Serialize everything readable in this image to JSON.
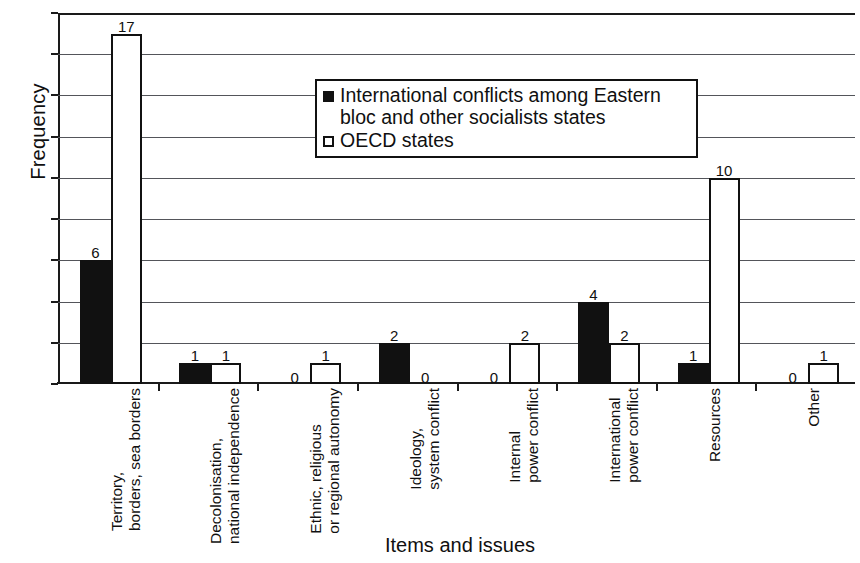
{
  "chart_data": {
    "type": "bar",
    "title": "",
    "xlabel": "Items and issues",
    "ylabel": "Frequency",
    "ylim": [
      0,
      18
    ],
    "ytick_step": 2,
    "yticks": [
      0,
      2,
      4,
      6,
      8,
      10,
      12,
      14,
      16,
      18
    ],
    "grid": true,
    "legend_position": "inside-top-center",
    "categories": [
      "Territory, borders, sea borders",
      "Decolonisation, national independence",
      "Ethnic, religious or regional autonomy",
      "Ideology, system conflict",
      "Internal power conflict",
      "International power conflict",
      "Resources",
      "Other"
    ],
    "category_lines": [
      [
        "Territory,",
        "borders, sea borders"
      ],
      [
        "Decolonisation,",
        "national independence"
      ],
      [
        "Ethnic, religious",
        "or regional autonomy"
      ],
      [
        "Ideology,",
        "system conflict"
      ],
      [
        "Internal",
        "power conflict"
      ],
      [
        "International",
        "power conflict"
      ],
      [
        "Resources"
      ],
      [
        "Other"
      ]
    ],
    "series": [
      {
        "name": "International conflicts among Eastern bloc and other socialists states",
        "name_lines": [
          "International conflicts among Eastern",
          "bloc and other socialists states"
        ],
        "color": "#111111",
        "style": "filled",
        "values": [
          6,
          1,
          0,
          2,
          0,
          4,
          1,
          0
        ]
      },
      {
        "name": "OECD states",
        "name_lines": [
          "OECD states"
        ],
        "color": "#ffffff",
        "style": "outlined",
        "values": [
          17,
          1,
          1,
          0,
          2,
          2,
          10,
          1
        ]
      }
    ]
  }
}
